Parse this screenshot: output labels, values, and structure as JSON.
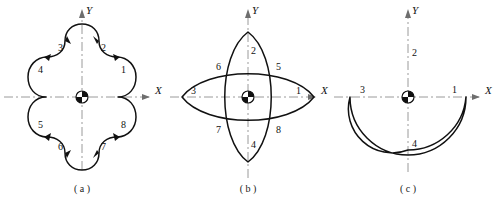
{
  "figure": {
    "background_color": "#ffffff",
    "curve_color": "#111111",
    "axis_color": "#9a9a9a",
    "panels": [
      {
        "id": "a",
        "caption": "( a )",
        "shape_name": "quatrefoil-contour",
        "axis_x_label": "X",
        "axis_y_label": "Y",
        "origin_marker": "quadrant-target",
        "point_labels": [
          "1",
          "2",
          "3",
          "4",
          "5",
          "6",
          "7",
          "8"
        ]
      },
      {
        "id": "b",
        "caption": "( b )",
        "shape_name": "crossed-lens-contour",
        "axis_x_label": "X",
        "axis_y_label": "Y",
        "origin_marker": "quadrant-target",
        "point_labels": [
          "1",
          "2",
          "3",
          "4",
          "5",
          "6",
          "7",
          "8"
        ]
      },
      {
        "id": "c",
        "caption": "( c )",
        "shape_name": "circle-with-concave-notch",
        "axis_x_label": "X",
        "axis_y_label": "Y",
        "origin_marker": "quadrant-target",
        "point_labels": [
          "1",
          "2",
          "3",
          "4"
        ]
      }
    ]
  },
  "panel_a": {
    "caption": "( a )",
    "x_label": "X",
    "y_label": "Y",
    "labels": {
      "p1": "1",
      "p2": "2",
      "p3": "3",
      "p4": "4",
      "p5": "5",
      "p6": "6",
      "p7": "7",
      "p8": "8"
    }
  },
  "panel_b": {
    "caption": "( b )",
    "x_label": "X",
    "y_label": "Y",
    "labels": {
      "p1": "1",
      "p2": "2",
      "p3": "3",
      "p4": "4",
      "p5": "5",
      "p6": "6",
      "p7": "7",
      "p8": "8"
    }
  },
  "panel_c": {
    "caption": "( c )",
    "x_label": "X",
    "y_label": "Y",
    "labels": {
      "p1": "1",
      "p2": "2",
      "p3": "3",
      "p4": "4"
    }
  }
}
